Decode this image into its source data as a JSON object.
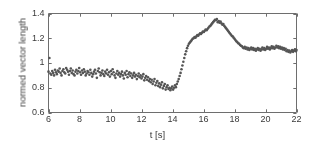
{
  "chart_data": {
    "type": "scatter",
    "title": "",
    "xlabel": "t [s]",
    "ylabel": "normed vector length",
    "xlim": [
      6,
      22
    ],
    "ylim": [
      0.6,
      1.4
    ],
    "xticks": [
      6,
      8,
      10,
      12,
      14,
      16,
      18,
      20,
      22
    ],
    "yticks": [
      0.6,
      0.8,
      1,
      1.2,
      1.4
    ],
    "xticklabels": [
      "6",
      "8",
      "10",
      "12",
      "14",
      "16",
      "18",
      "20",
      "22"
    ],
    "yticklabels": [
      "0.6",
      "0.8",
      "1",
      "1.2",
      "1.4"
    ],
    "grid": false,
    "legend": null,
    "marker": "dot",
    "marker_color": "#555555",
    "marker_size": 1.3,
    "box": true,
    "series": [
      {
        "name": "normed vector length",
        "x": [
          6.0,
          6.06,
          6.12,
          6.18,
          6.24,
          6.3,
          6.36,
          6.42,
          6.48,
          6.54,
          6.6,
          6.66,
          6.72,
          6.78,
          6.84,
          6.9,
          6.96,
          7.02,
          7.08,
          7.14,
          7.2,
          7.26,
          7.32,
          7.38,
          7.44,
          7.5,
          7.56,
          7.62,
          7.68,
          7.74,
          7.8,
          7.86,
          7.92,
          7.98,
          8.04,
          8.1,
          8.16,
          8.22,
          8.28,
          8.34,
          8.4,
          8.46,
          8.52,
          8.58,
          8.64,
          8.7,
          8.76,
          8.82,
          8.88,
          8.94,
          9.0,
          9.06,
          9.12,
          9.18,
          9.24,
          9.3,
          9.36,
          9.42,
          9.48,
          9.54,
          9.6,
          9.66,
          9.72,
          9.78,
          9.84,
          9.9,
          9.96,
          10.02,
          10.08,
          10.14,
          10.2,
          10.26,
          10.32,
          10.38,
          10.44,
          10.5,
          10.56,
          10.62,
          10.68,
          10.74,
          10.8,
          10.86,
          10.92,
          10.98,
          11.04,
          11.1,
          11.16,
          11.22,
          11.28,
          11.34,
          11.4,
          11.46,
          11.52,
          11.58,
          11.64,
          11.7,
          11.76,
          11.82,
          11.88,
          11.94,
          12.0,
          12.06,
          12.12,
          12.18,
          12.24,
          12.3,
          12.36,
          12.42,
          12.48,
          12.54,
          12.6,
          12.66,
          12.72,
          12.78,
          12.84,
          12.9,
          12.96,
          13.02,
          13.08,
          13.14,
          13.2,
          13.26,
          13.32,
          13.38,
          13.44,
          13.5,
          13.56,
          13.62,
          13.68,
          13.74,
          13.8,
          13.86,
          13.92,
          13.98,
          14.04,
          14.1,
          14.16,
          14.22,
          14.28,
          14.34,
          14.4,
          14.46,
          14.52,
          14.58,
          14.64,
          14.7,
          14.76,
          14.82,
          14.88,
          14.94,
          15.0,
          15.06,
          15.12,
          15.18,
          15.24,
          15.3,
          15.36,
          15.42,
          15.48,
          15.54,
          15.6,
          15.66,
          15.72,
          15.78,
          15.84,
          15.9,
          15.96,
          16.02,
          16.08,
          16.14,
          16.2,
          16.26,
          16.32,
          16.38,
          16.44,
          16.5,
          16.56,
          16.62,
          16.68,
          16.74,
          16.8,
          16.86,
          16.92,
          16.98,
          17.04,
          17.1,
          17.16,
          17.22,
          17.28,
          17.34,
          17.4,
          17.46,
          17.52,
          17.58,
          17.64,
          17.7,
          17.76,
          17.82,
          17.88,
          17.94,
          18.0,
          18.06,
          18.12,
          18.18,
          18.24,
          18.3,
          18.36,
          18.42,
          18.48,
          18.54,
          18.6,
          18.66,
          18.72,
          18.78,
          18.84,
          18.9,
          18.96,
          19.02,
          19.08,
          19.14,
          19.2,
          19.26,
          19.32,
          19.38,
          19.44,
          19.5,
          19.56,
          19.62,
          19.68,
          19.74,
          19.8,
          19.86,
          19.92,
          19.98,
          20.04,
          20.1,
          20.16,
          20.22,
          20.28,
          20.34,
          20.4,
          20.46,
          20.52,
          20.58,
          20.64,
          20.7,
          20.76,
          20.82,
          20.88,
          20.94,
          21.0,
          21.06,
          21.12,
          21.18,
          21.24,
          21.3,
          21.36,
          21.42,
          21.48,
          21.54,
          21.6,
          21.66,
          21.72,
          21.78,
          21.84,
          21.9,
          21.96,
          22.0
        ],
        "y": [
          0.93,
          1.04,
          0.915,
          0.905,
          0.935,
          0.92,
          0.9,
          0.945,
          0.925,
          0.91,
          0.94,
          0.93,
          0.955,
          0.92,
          0.9,
          0.935,
          0.95,
          0.925,
          0.915,
          0.96,
          0.945,
          0.93,
          0.905,
          0.935,
          0.955,
          0.92,
          0.94,
          0.91,
          0.9,
          0.93,
          0.945,
          0.915,
          0.935,
          0.96,
          0.925,
          0.905,
          0.94,
          0.92,
          0.95,
          0.93,
          0.9,
          0.915,
          0.935,
          0.925,
          0.905,
          0.945,
          0.92,
          0.89,
          0.91,
          0.93,
          0.945,
          0.915,
          0.88,
          0.935,
          0.955,
          0.925,
          0.9,
          0.92,
          0.94,
          0.91,
          0.895,
          0.93,
          0.915,
          0.945,
          0.905,
          0.925,
          0.89,
          0.935,
          0.91,
          0.95,
          0.925,
          0.9,
          0.88,
          0.915,
          0.935,
          0.905,
          0.92,
          0.89,
          0.91,
          0.93,
          0.9,
          0.875,
          0.92,
          0.905,
          0.935,
          0.885,
          0.91,
          0.925,
          0.895,
          0.915,
          0.88,
          0.9,
          0.92,
          0.89,
          0.905,
          0.87,
          0.895,
          0.915,
          0.885,
          0.9,
          0.875,
          0.89,
          0.91,
          0.86,
          0.88,
          0.895,
          0.865,
          0.885,
          0.855,
          0.87,
          0.845,
          0.865,
          0.83,
          0.85,
          0.87,
          0.82,
          0.84,
          0.855,
          0.815,
          0.835,
          0.805,
          0.825,
          0.845,
          0.795,
          0.815,
          0.83,
          0.785,
          0.805,
          0.82,
          0.79,
          0.8,
          0.78,
          0.795,
          0.81,
          0.785,
          0.8,
          0.82,
          0.805,
          0.83,
          0.85,
          0.87,
          0.895,
          0.92,
          0.95,
          0.98,
          1.01,
          1.04,
          1.07,
          1.095,
          1.12,
          1.14,
          1.155,
          1.165,
          1.175,
          1.185,
          1.195,
          1.2,
          1.21,
          1.205,
          1.215,
          1.225,
          1.22,
          1.23,
          1.24,
          1.235,
          1.245,
          1.255,
          1.25,
          1.26,
          1.27,
          1.265,
          1.275,
          1.285,
          1.295,
          1.3,
          1.31,
          1.32,
          1.33,
          1.34,
          1.35,
          1.345,
          1.355,
          1.33,
          1.34,
          1.325,
          1.335,
          1.32,
          1.31,
          1.315,
          1.3,
          1.29,
          1.28,
          1.27,
          1.26,
          1.25,
          1.24,
          1.23,
          1.22,
          1.215,
          1.205,
          1.195,
          1.185,
          1.175,
          1.17,
          1.16,
          1.155,
          1.145,
          1.14,
          1.135,
          1.125,
          1.12,
          1.13,
          1.115,
          1.125,
          1.11,
          1.12,
          1.105,
          1.115,
          1.125,
          1.11,
          1.12,
          1.105,
          1.115,
          1.1,
          1.11,
          1.12,
          1.105,
          1.115,
          1.1,
          1.11,
          1.125,
          1.11,
          1.12,
          1.105,
          1.115,
          1.13,
          1.115,
          1.125,
          1.11,
          1.12,
          1.135,
          1.12,
          1.13,
          1.115,
          1.125,
          1.14,
          1.125,
          1.135,
          1.12,
          1.13,
          1.115,
          1.125,
          1.11,
          1.12,
          1.105,
          1.115,
          1.095,
          1.105,
          1.09,
          1.1,
          1.085,
          1.095,
          1.105,
          1.09,
          1.1,
          1.11,
          1.095,
          1.105
        ]
      }
    ]
  },
  "axes": {
    "xlabel": "t [s]",
    "ylabel": "normed vector length"
  }
}
